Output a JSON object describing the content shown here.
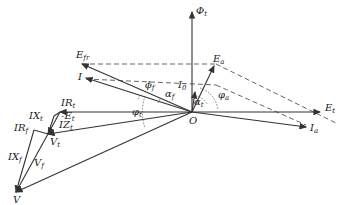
{
  "diagram": {
    "type": "phasor-diagram",
    "origin_label": "O",
    "phasors": [
      {
        "id": "phi_t",
        "label": "Φ",
        "sub": "t"
      },
      {
        "id": "E_t",
        "label": "E",
        "sub": "t"
      },
      {
        "id": "E_a",
        "label": "E",
        "sub": "a"
      },
      {
        "id": "E_fr",
        "label": "E",
        "sub": "fr"
      },
      {
        "id": "I",
        "label": "I",
        "sub": ""
      },
      {
        "id": "I_a",
        "label": "I",
        "sub": "a"
      },
      {
        "id": "I_0",
        "label": "I",
        "sub": "0"
      },
      {
        "id": "neg_E_t",
        "label": "-E",
        "sub": "t"
      },
      {
        "id": "IR_t",
        "label": "IR",
        "sub": "t"
      },
      {
        "id": "IX_t",
        "label": "IX",
        "sub": "t"
      },
      {
        "id": "IZ_t",
        "label": "IZ",
        "sub": "t"
      },
      {
        "id": "V_t",
        "label": "V",
        "sub": "t"
      },
      {
        "id": "IR_f",
        "label": "IR",
        "sub": "f"
      },
      {
        "id": "IX_f",
        "label": "IX",
        "sub": "f"
      },
      {
        "id": "V_f",
        "label": "V",
        "sub": "f"
      },
      {
        "id": "V",
        "label": "V",
        "sub": ""
      }
    ],
    "angles": [
      {
        "id": "phi_f",
        "label": "ϕ",
        "sub": "f"
      },
      {
        "id": "alpha_f",
        "label": "α",
        "sub": "f"
      },
      {
        "id": "alpha_t",
        "label": "α",
        "sub": "t"
      },
      {
        "id": "phi_a",
        "label": "φ",
        "sub": "a"
      },
      {
        "id": "phi_t_angle",
        "label": "φ",
        "sub": "t"
      }
    ]
  }
}
